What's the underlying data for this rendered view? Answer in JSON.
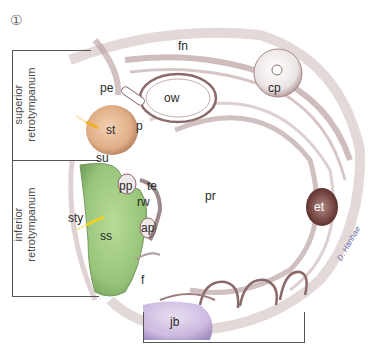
{
  "figure": {
    "number": "①",
    "signature": "D. Hanhae"
  },
  "regions": {
    "superior": "superior\nretrotympanum",
    "superior_line1": "superior",
    "superior_line2": "retrotympanum",
    "inferior_line1": "inferior",
    "inferior_line2": "retrotympanum"
  },
  "labels": {
    "fn": "fn",
    "pe": "pe",
    "ow": "ow",
    "cp": "cp",
    "st": "st",
    "p": "p",
    "su": "su",
    "pp": "pp",
    "te": "te",
    "rw": "rw",
    "sty": "sty",
    "ss": "ss",
    "ap": "ap",
    "pr": "pr",
    "et": "et",
    "f": "f",
    "jb": "jb"
  },
  "colors": {
    "stapes_region": "#e2b48e",
    "sinus_tympani": "#9cc87e",
    "jugular_bulb": "#c8b6dc",
    "eustachian": "#6e3e3a",
    "bone_shadow": "#8c6a6a",
    "pointer": "#f0b020"
  }
}
